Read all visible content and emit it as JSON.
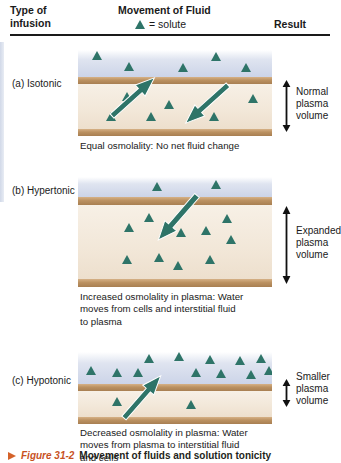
{
  "header": {
    "type_col": "Type of\ninfusion",
    "type_col_line1": "Type of",
    "type_col_line2": "infusion",
    "movement_title": "Movement of Fluid",
    "legend_text": "= solute",
    "legend_icon": "triangle-solute-icon",
    "result_col": "Result"
  },
  "colors": {
    "solute": "#2e7468",
    "arrow": "#2e7468",
    "membrane": "#bb9161",
    "plasma": "#f2e7d8",
    "interstitial": "#ccd4e8",
    "caption_accent": "#c8521f"
  },
  "panels": [
    {
      "label": "(a) Isotonic",
      "caption": "Equal osmolality: No net fluid change",
      "result_line1": "Normal",
      "result_line2": "plasma",
      "result_line3": "volume",
      "arrow_description": "two opposing arrows: outward up-right and inward down-left"
    },
    {
      "label": "(b) Hypertonic",
      "caption_line1": "Increased osmolality in plasma: Water",
      "caption_line2": "moves from cells and interstitial fluid",
      "caption_line3": "to plasma",
      "result_line1": "Expanded",
      "result_line2": "plasma",
      "result_line3": "volume",
      "arrow_description": "single arrow pointing down-left into plasma"
    },
    {
      "label": "(c) Hypotonic",
      "caption_line1": "Decreased osmolality in plasma: Water",
      "caption_line2": "moves from plasma to interstitial fluid",
      "caption_line3": "and cells",
      "result_line1": "Smaller",
      "result_line2": "plasma",
      "result_line3": "volume",
      "arrow_description": "single arrow pointing up-right out of plasma"
    }
  ],
  "figure_caption": {
    "marker": "triangle-marker-icon",
    "number": "Figure 31-2",
    "text": "Movement of fluids and solution tonicity"
  }
}
